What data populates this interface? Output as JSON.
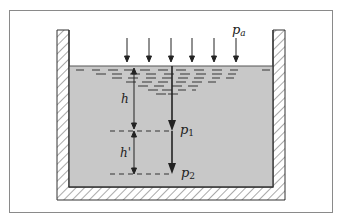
{
  "diagram": {
    "labels": {
      "atmospheric_pressure": "p",
      "atmospheric_pressure_sub": "a",
      "depth_h": "h",
      "depth_h_prime": "h'",
      "pressure_1": "p",
      "pressure_1_sub": "1",
      "pressure_2": "p",
      "pressure_2_sub": "2"
    },
    "colors": {
      "frame_border": "#8a8a8a",
      "liquid_fill": "#c8c8c8",
      "wall_outline": "#333333",
      "hatch": "#555555",
      "arrows": "#222222"
    },
    "surface_arrow_count": 6
  }
}
